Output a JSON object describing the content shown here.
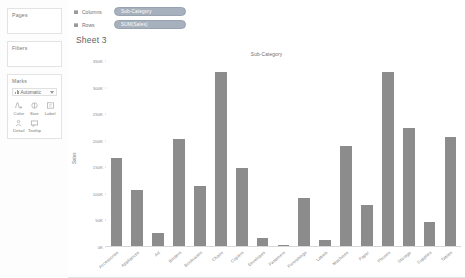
{
  "sidebar": {
    "pages": {
      "title": "Pages"
    },
    "filters": {
      "title": "Filters"
    },
    "marks": {
      "title": "Marks",
      "type_label": "Automatic",
      "buttons": [
        {
          "label": "Color",
          "icon": "color-palette-icon"
        },
        {
          "label": "Size",
          "icon": "size-icon"
        },
        {
          "label": "Label",
          "icon": "label-icon"
        },
        {
          "label": "Detail",
          "icon": "detail-icon"
        },
        {
          "label": "Tooltip",
          "icon": "tooltip-icon"
        }
      ]
    }
  },
  "shelves": {
    "columns": {
      "label": "Columns",
      "pill": "Sub-Category"
    },
    "rows": {
      "label": "Rows",
      "pill": "SUM(Sales)"
    }
  },
  "sheet": {
    "title": "Sheet 3"
  },
  "colors": {
    "bar": "#8c8c8c",
    "pill": "#a7b0bd",
    "axis": "#d8d8d8",
    "text": "#6f6f6f"
  },
  "chart_data": {
    "type": "bar",
    "title": "Sub-Category",
    "xlabel": "",
    "ylabel": "Sales",
    "ylim": [
      0,
      350000
    ],
    "grid": false,
    "legend": null,
    "ticks": [
      "350K",
      "300K",
      "250K",
      "200K",
      "150K",
      "100K",
      "50K",
      "0K"
    ],
    "tick_values": [
      350000,
      300000,
      250000,
      200000,
      150000,
      100000,
      50000,
      0
    ],
    "categories": [
      "Accessories",
      "Appliances",
      "Art",
      "Binders",
      "Bookcases",
      "Chairs",
      "Copiers",
      "Envelopes",
      "Fasteners",
      "Furnishings",
      "Labels",
      "Machines",
      "Paper",
      "Phones",
      "Storage",
      "Supplies",
      "Tables"
    ],
    "values": [
      167380,
      107532,
      27119,
      203413,
      114880,
      328449,
      149528,
      16476,
      3024,
      91705,
      12486,
      189239,
      78479,
      330007,
      223844,
      46674,
      206966
    ]
  }
}
